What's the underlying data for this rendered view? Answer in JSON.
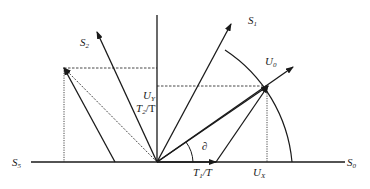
{
  "diagram": {
    "type": "space-vector-diagram",
    "colors": {
      "line": "#1a1a1a",
      "background": "#ffffff"
    },
    "labels": {
      "s1": {
        "base": "S",
        "sub": "1"
      },
      "s2": {
        "base": "S",
        "sub": "2"
      },
      "s5": {
        "base": "S",
        "sub": "5"
      },
      "s0": {
        "base": "S",
        "sub": "0"
      },
      "u0": {
        "base": "U",
        "sub": "0"
      },
      "uy": {
        "base": "U",
        "sub": "Y"
      },
      "t2": {
        "base": "T",
        "sub": "2",
        "suffix": "/T"
      },
      "t1": {
        "base": "T",
        "sub": "1",
        "suffix": "/T"
      },
      "ux": {
        "base": "U",
        "sub": "X"
      },
      "angle": "∂"
    }
  }
}
